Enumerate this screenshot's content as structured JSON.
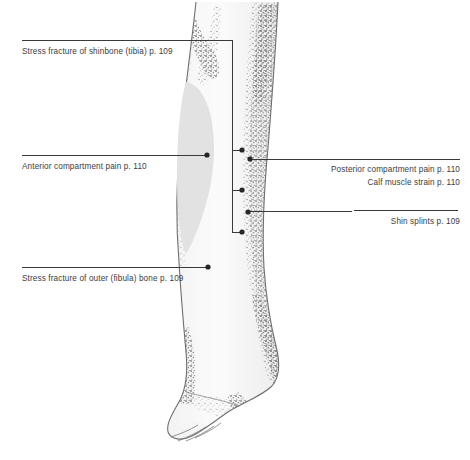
{
  "figure": {
    "background_color": "#ffffff",
    "line_color": "#3a3a3a",
    "text_color": "#3c3c3c",
    "muscle_highlight_color": "#e2e2e2",
    "illustration_color": "#8c8c8c"
  },
  "labels": {
    "left": [
      {
        "id": "stress-fracture-tibia",
        "text": "Stress fracture of shinbone (tibia) p. 109",
        "page": "p. 109",
        "x": 22,
        "y": 46,
        "align": "left"
      },
      {
        "id": "anterior-compartment-pain",
        "text": "Anterior compartment pain p. 110",
        "page": "p. 110",
        "x": 22,
        "y": 161,
        "align": "left"
      },
      {
        "id": "stress-fracture-fibula",
        "text": "Stress fracture of outer (fibula) bone p. 109",
        "page": "p. 109",
        "x": 22,
        "y": 273,
        "align": "left"
      }
    ],
    "right": [
      {
        "id": "posterior-compartment-pain",
        "text": "Posterior compartment pain p. 110",
        "page": "p. 110",
        "x": 313,
        "y": 164,
        "align": "right"
      },
      {
        "id": "calf-muscle-strain",
        "text": "Calf muscle strain p. 110",
        "page": "p. 110",
        "x": 313,
        "y": 177,
        "align": "right"
      },
      {
        "id": "shin-splints",
        "text": "Shin splints p. 109",
        "page": "p. 109",
        "x": 313,
        "y": 216,
        "align": "right"
      }
    ]
  },
  "markers": [
    {
      "id": "marker-anterior-compartment",
      "x": 207,
      "y": 155
    },
    {
      "id": "marker-fibula-stress-fracture",
      "x": 208,
      "y": 268
    },
    {
      "id": "marker-tibia-stress-fracture",
      "x": 242,
      "y": 150
    },
    {
      "id": "marker-calf-muscle-strain",
      "x": 242,
      "y": 190
    },
    {
      "id": "marker-bracket-foot",
      "x": 242,
      "y": 232
    },
    {
      "id": "marker-posterior-compartment",
      "x": 250,
      "y": 159
    },
    {
      "id": "marker-shin-splints",
      "x": 248,
      "y": 212
    }
  ]
}
